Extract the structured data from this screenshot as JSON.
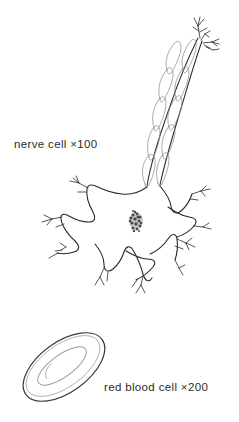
{
  "figure": {
    "type": "biology-illustration",
    "background_color": "#ffffff",
    "ink_color": "#2b2b2b",
    "light_ink_color": "#9a9a9a",
    "labels": {
      "nerve_cell": "nerve cell ×100",
      "red_blood_cell": "red blood cell ×200"
    },
    "specimens": [
      {
        "name": "nerve-cell",
        "label": "nerve cell ×100",
        "magnification": "×100",
        "parts": [
          "axon-terminal",
          "myelinated-axon",
          "myelin-sheath-segments",
          "axon-hillock",
          "soma",
          "nucleus",
          "dendrites"
        ]
      },
      {
        "name": "red-blood-cell",
        "label": "red blood cell ×200",
        "magnification": "×200",
        "parts": [
          "outer-membrane",
          "central-depression"
        ]
      }
    ]
  }
}
